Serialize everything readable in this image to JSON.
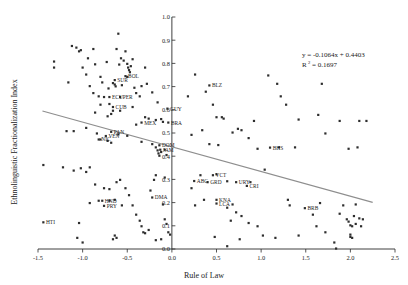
{
  "chart_data": {
    "type": "scatter",
    "title": "",
    "xlabel": "Rule of Law",
    "ylabel": "Ethnolinguistic Fractionalization Index",
    "xlim": [
      -1.5,
      2.5
    ],
    "ylim": [
      0.0,
      1.0
    ],
    "xticks": [
      -1.5,
      -1.0,
      -0.5,
      0.0,
      0.5,
      1.0,
      1.5,
      2.0,
      2.5
    ],
    "xtick_labels": [
      "-1.5",
      "-1.0",
      "-0.5",
      "0.0",
      "0.5",
      "1.0",
      "1.5",
      "2.0",
      "2.5"
    ],
    "yticks": [
      0.0,
      0.1,
      0.2,
      0.3,
      0.4,
      0.5,
      0.6,
      0.7,
      0.8,
      0.9,
      1.0
    ],
    "ytick_labels": [
      "0.0",
      "0.1",
      "0.2",
      "0.3",
      "0.4",
      "0.5",
      "0.6",
      "0.7",
      "0.8",
      "0.9",
      "1.0"
    ],
    "grid": false,
    "legend": false,
    "annotations": {
      "equation": "y = -0.1064x + 0.4403",
      "r_squared_label": "R",
      "r_squared_sup": "2",
      "r_squared_value": "= 0.1697"
    },
    "trendline": {
      "slope": -0.1064,
      "intercept": 0.4403,
      "x_start": -1.45,
      "x_end": 2.25,
      "color": "#8e8e8e"
    },
    "marker_color": "#2d2d2d",
    "labeled_points": [
      {
        "label": "BOL",
        "x": -0.52,
        "y": 0.745
      },
      {
        "label": "SUR",
        "x": -0.64,
        "y": 0.728
      },
      {
        "label": "ECU",
        "x": -0.7,
        "y": 0.655
      },
      {
        "label": "PER",
        "x": -0.58,
        "y": 0.655
      },
      {
        "label": "CUB",
        "x": -0.66,
        "y": 0.612
      },
      {
        "label": "MEX",
        "x": -0.34,
        "y": 0.545
      },
      {
        "label": "BRA",
        "x": -0.04,
        "y": 0.545
      },
      {
        "label": "GUY",
        "x": -0.05,
        "y": 0.605
      },
      {
        "label": "PAN",
        "x": -0.68,
        "y": 0.505
      },
      {
        "label": "VEN",
        "x": -0.74,
        "y": 0.487
      },
      {
        "label": "NIC",
        "x": -0.82,
        "y": 0.472
      },
      {
        "label": "DOM",
        "x": -0.14,
        "y": 0.447
      },
      {
        "label": "JAM",
        "x": -0.13,
        "y": 0.428
      },
      {
        "label": "BLZ",
        "x": 0.42,
        "y": 0.705
      },
      {
        "label": "BHS",
        "x": 1.1,
        "y": 0.437
      },
      {
        "label": "VCT",
        "x": 0.46,
        "y": 0.318
      },
      {
        "label": "ABG",
        "x": 0.25,
        "y": 0.293
      },
      {
        "label": "GRD",
        "x": 0.4,
        "y": 0.288
      },
      {
        "label": "URY",
        "x": 0.72,
        "y": 0.288
      },
      {
        "label": "CRI",
        "x": 0.84,
        "y": 0.272
      },
      {
        "label": "KNA",
        "x": 0.5,
        "y": 0.212
      },
      {
        "label": "LCA",
        "x": 0.5,
        "y": 0.196
      },
      {
        "label": "DMA",
        "x": -0.22,
        "y": 0.222
      },
      {
        "label": "HND",
        "x": -0.78,
        "y": 0.208
      },
      {
        "label": "PRY",
        "x": -0.76,
        "y": 0.186
      },
      {
        "label": "HTI",
        "x": -1.44,
        "y": 0.115
      },
      {
        "label": "BRB",
        "x": 1.49,
        "y": 0.176
      }
    ],
    "points": [
      {
        "x": -1.32,
        "y": 0.808
      },
      {
        "x": -1.32,
        "y": 0.782
      },
      {
        "x": -1.12,
        "y": 0.875
      },
      {
        "x": -1.07,
        "y": 0.868
      },
      {
        "x": -1.04,
        "y": 0.852
      },
      {
        "x": -1.02,
        "y": 0.857
      },
      {
        "x": -1.16,
        "y": 0.718
      },
      {
        "x": -0.94,
        "y": 0.822
      },
      {
        "x": -0.88,
        "y": 0.862
      },
      {
        "x": -0.86,
        "y": 0.796
      },
      {
        "x": -0.8,
        "y": 0.742
      },
      {
        "x": -0.78,
        "y": 0.718
      },
      {
        "x": -0.76,
        "y": 0.655
      },
      {
        "x": -0.73,
        "y": 0.806
      },
      {
        "x": -0.71,
        "y": 0.692
      },
      {
        "x": -0.7,
        "y": 0.625
      },
      {
        "x": -0.68,
        "y": 0.582
      },
      {
        "x": -0.66,
        "y": 0.715
      },
      {
        "x": -0.64,
        "y": 0.709
      },
      {
        "x": -0.63,
        "y": 0.701
      },
      {
        "x": -0.62,
        "y": 0.862
      },
      {
        "x": -0.6,
        "y": 0.928
      },
      {
        "x": -0.59,
        "y": 0.795
      },
      {
        "x": -0.57,
        "y": 0.822
      },
      {
        "x": -0.56,
        "y": 0.706
      },
      {
        "x": -0.54,
        "y": 0.812
      },
      {
        "x": -0.52,
        "y": 0.852
      },
      {
        "x": -0.5,
        "y": 0.798
      },
      {
        "x": -0.49,
        "y": 0.782
      },
      {
        "x": -0.48,
        "y": 0.771
      },
      {
        "x": -0.47,
        "y": 0.762
      },
      {
        "x": -0.46,
        "y": 0.788
      },
      {
        "x": -0.5,
        "y": 0.742
      },
      {
        "x": -0.44,
        "y": 0.818
      },
      {
        "x": -0.42,
        "y": 0.695
      },
      {
        "x": -0.4,
        "y": 0.672
      },
      {
        "x": -0.36,
        "y": 0.658
      },
      {
        "x": -0.34,
        "y": 0.702
      },
      {
        "x": -0.3,
        "y": 0.782
      },
      {
        "x": -0.28,
        "y": 0.712
      },
      {
        "x": -0.22,
        "y": 0.675
      },
      {
        "x": -0.16,
        "y": 0.632
      },
      {
        "x": -0.12,
        "y": 0.56
      },
      {
        "x": -0.1,
        "y": 0.548
      },
      {
        "x": -0.18,
        "y": 0.556
      },
      {
        "x": -0.26,
        "y": 0.562
      },
      {
        "x": -0.3,
        "y": 0.568
      },
      {
        "x": -0.44,
        "y": 0.612
      },
      {
        "x": -0.58,
        "y": 0.596
      },
      {
        "x": -0.66,
        "y": 0.596
      },
      {
        "x": -0.72,
        "y": 0.572
      },
      {
        "x": -0.8,
        "y": 0.622
      },
      {
        "x": -0.82,
        "y": 0.658
      },
      {
        "x": -0.86,
        "y": 0.588
      },
      {
        "x": -0.88,
        "y": 0.672
      },
      {
        "x": -0.92,
        "y": 0.702
      },
      {
        "x": -0.96,
        "y": 0.752
      },
      {
        "x": -1.0,
        "y": 0.782
      },
      {
        "x": -1.1,
        "y": 0.508
      },
      {
        "x": -1.18,
        "y": 0.508
      },
      {
        "x": -0.96,
        "y": 0.522
      },
      {
        "x": -0.84,
        "y": 0.498
      },
      {
        "x": -0.8,
        "y": 0.472
      },
      {
        "x": -0.72,
        "y": 0.466
      },
      {
        "x": -0.68,
        "y": 0.458
      },
      {
        "x": -0.6,
        "y": 0.494
      },
      {
        "x": -0.5,
        "y": 0.488
      },
      {
        "x": -0.4,
        "y": 0.536
      },
      {
        "x": -0.34,
        "y": 0.462
      },
      {
        "x": -0.22,
        "y": 0.452
      },
      {
        "x": -0.18,
        "y": 0.438
      },
      {
        "x": -0.16,
        "y": 0.425
      },
      {
        "x": -0.15,
        "y": 0.412
      },
      {
        "x": -0.14,
        "y": 0.402
      },
      {
        "x": -0.12,
        "y": 0.418
      },
      {
        "x": -0.08,
        "y": 0.428
      },
      {
        "x": -0.06,
        "y": 0.405
      },
      {
        "x": -1.44,
        "y": 0.362
      },
      {
        "x": -1.22,
        "y": 0.352
      },
      {
        "x": -1.1,
        "y": 0.338
      },
      {
        "x": -1.02,
        "y": 0.348
      },
      {
        "x": -0.96,
        "y": 0.332
      },
      {
        "x": -0.92,
        "y": 0.352
      },
      {
        "x": -0.86,
        "y": 0.278
      },
      {
        "x": -0.76,
        "y": 0.262
      },
      {
        "x": -0.7,
        "y": 0.258
      },
      {
        "x": -0.62,
        "y": 0.288
      },
      {
        "x": -0.58,
        "y": 0.298
      },
      {
        "x": -0.52,
        "y": 0.262
      },
      {
        "x": -0.48,
        "y": 0.232
      },
      {
        "x": -0.44,
        "y": 0.188
      },
      {
        "x": -0.4,
        "y": 0.148
      },
      {
        "x": -0.36,
        "y": 0.122
      },
      {
        "x": -0.34,
        "y": 0.098
      },
      {
        "x": -0.32,
        "y": 0.072
      },
      {
        "x": -0.3,
        "y": 0.068
      },
      {
        "x": -0.26,
        "y": 0.082
      },
      {
        "x": -0.24,
        "y": 0.252
      },
      {
        "x": -0.2,
        "y": 0.298
      },
      {
        "x": -0.18,
        "y": 0.318
      },
      {
        "x": -0.08,
        "y": 0.308
      },
      {
        "x": -0.1,
        "y": 0.192
      },
      {
        "x": -0.08,
        "y": 0.128
      },
      {
        "x": -0.06,
        "y": 0.108
      },
      {
        "x": -0.04,
        "y": 0.072
      },
      {
        "x": -0.02,
        "y": 0.062
      },
      {
        "x": -0.12,
        "y": 0.042
      },
      {
        "x": -0.18,
        "y": 0.038
      },
      {
        "x": -0.62,
        "y": 0.048
      },
      {
        "x": -0.64,
        "y": 0.058
      },
      {
        "x": -0.66,
        "y": 0.042
      },
      {
        "x": -1.0,
        "y": 0.028
      },
      {
        "x": -1.04,
        "y": 0.112
      },
      {
        "x": -0.92,
        "y": 0.198
      },
      {
        "x": -0.82,
        "y": 0.208
      },
      {
        "x": -0.7,
        "y": 0.208
      },
      {
        "x": -0.64,
        "y": 0.212
      },
      {
        "x": -0.56,
        "y": 0.188
      },
      {
        "x": -1.06,
        "y": 0.048
      },
      {
        "x": 0.18,
        "y": 0.658
      },
      {
        "x": 0.26,
        "y": 0.752
      },
      {
        "x": 0.38,
        "y": 0.678
      },
      {
        "x": 0.46,
        "y": 0.622
      },
      {
        "x": 0.5,
        "y": 0.568
      },
      {
        "x": 0.56,
        "y": 0.568
      },
      {
        "x": 0.58,
        "y": 0.562
      },
      {
        "x": 0.22,
        "y": 0.492
      },
      {
        "x": 0.34,
        "y": 0.512
      },
      {
        "x": 0.42,
        "y": 0.452
      },
      {
        "x": 0.52,
        "y": 0.448
      },
      {
        "x": 0.68,
        "y": 0.502
      },
      {
        "x": 0.74,
        "y": 0.518
      },
      {
        "x": 0.78,
        "y": 0.512
      },
      {
        "x": 0.86,
        "y": 0.478
      },
      {
        "x": 0.92,
        "y": 0.552
      },
      {
        "x": 0.96,
        "y": 0.432
      },
      {
        "x": 1.04,
        "y": 0.342
      },
      {
        "x": 1.08,
        "y": 0.748
      },
      {
        "x": 1.18,
        "y": 0.712
      },
      {
        "x": 1.22,
        "y": 0.658
      },
      {
        "x": 1.28,
        "y": 0.622
      },
      {
        "x": 1.2,
        "y": 0.438
      },
      {
        "x": 1.38,
        "y": 0.438
      },
      {
        "x": 1.42,
        "y": 0.558
      },
      {
        "x": 1.64,
        "y": 0.578
      },
      {
        "x": 1.68,
        "y": 0.712
      },
      {
        "x": 1.72,
        "y": 0.498
      },
      {
        "x": 1.88,
        "y": 0.552
      },
      {
        "x": 1.98,
        "y": 0.432
      },
      {
        "x": 2.08,
        "y": 0.438
      },
      {
        "x": 2.1,
        "y": 0.552
      },
      {
        "x": 2.18,
        "y": 0.552
      },
      {
        "x": 0.22,
        "y": 0.262
      },
      {
        "x": 0.32,
        "y": 0.318
      },
      {
        "x": 0.5,
        "y": 0.322
      },
      {
        "x": 0.62,
        "y": 0.292
      },
      {
        "x": 0.88,
        "y": 0.288
      },
      {
        "x": 0.36,
        "y": 0.212
      },
      {
        "x": 0.26,
        "y": 0.188
      },
      {
        "x": 0.68,
        "y": 0.192
      },
      {
        "x": 0.62,
        "y": 0.178
      },
      {
        "x": 0.72,
        "y": 0.158
      },
      {
        "x": 0.78,
        "y": 0.142
      },
      {
        "x": 0.66,
        "y": 0.122
      },
      {
        "x": 0.86,
        "y": 0.112
      },
      {
        "x": 0.96,
        "y": 0.098
      },
      {
        "x": 0.48,
        "y": 0.052
      },
      {
        "x": 0.62,
        "y": 0.012
      },
      {
        "x": 0.76,
        "y": 0.042
      },
      {
        "x": 1.16,
        "y": 0.048
      },
      {
        "x": 1.02,
        "y": 0.058
      },
      {
        "x": 1.32,
        "y": 0.188
      },
      {
        "x": 1.58,
        "y": 0.148
      },
      {
        "x": 1.3,
        "y": 0.212
      },
      {
        "x": 1.42,
        "y": 0.058
      },
      {
        "x": 1.62,
        "y": 0.098
      },
      {
        "x": 1.72,
        "y": 0.072
      },
      {
        "x": 1.84,
        "y": 0.002
      },
      {
        "x": 1.88,
        "y": 0.152
      },
      {
        "x": 1.92,
        "y": 0.188
      },
      {
        "x": 1.96,
        "y": 0.128
      },
      {
        "x": 1.98,
        "y": 0.118
      },
      {
        "x": 2.0,
        "y": 0.102
      },
      {
        "x": 2.02,
        "y": 0.098
      },
      {
        "x": 2.0,
        "y": 0.062
      },
      {
        "x": 2.0,
        "y": 0.052
      },
      {
        "x": 2.02,
        "y": 0.048
      },
      {
        "x": 2.06,
        "y": 0.108
      },
      {
        "x": 2.1,
        "y": 0.132
      },
      {
        "x": 2.12,
        "y": 0.098
      },
      {
        "x": 2.14,
        "y": 0.128
      },
      {
        "x": 1.82,
        "y": 0.028
      },
      {
        "x": 1.66,
        "y": 0.198
      },
      {
        "x": 2.06,
        "y": 0.192
      },
      {
        "x": 2.04,
        "y": 0.142
      }
    ]
  }
}
